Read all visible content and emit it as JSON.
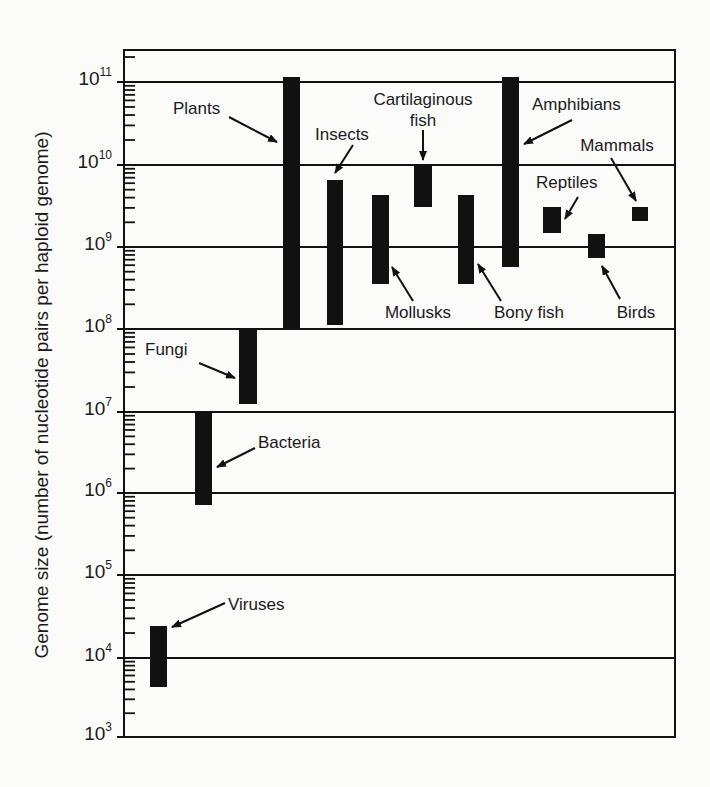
{
  "chart_data": {
    "type": "bar",
    "subtype": "floating-range-bars-log-scale",
    "title": "",
    "xlabel": "",
    "ylabel": "Genome size (number of nucleotide pairs per haploid genome)",
    "yscale": "log10",
    "ylim": [
      1000,
      200000000000
    ],
    "ytick_exponents": [
      3,
      4,
      5,
      6,
      7,
      8,
      9,
      10,
      11
    ],
    "ytick_labels": [
      "10^3",
      "10^4",
      "10^5",
      "10^6",
      "10^7",
      "10^8",
      "10^9",
      "10^10",
      "10^11"
    ],
    "grid": "horizontal at each decade",
    "legend": "none (direct labels with arrows)",
    "categories": [
      "Viruses",
      "Bacteria",
      "Fungi",
      "Plants",
      "Insects",
      "Mollusks",
      "Cartilaginous fish",
      "Bony fish",
      "Amphibians",
      "Reptiles",
      "Birds",
      "Mammals"
    ],
    "series": [
      {
        "name": "min_genome_size",
        "values": [
          4200,
          740000,
          13000000,
          100000000,
          110000000,
          350000000,
          3200000000,
          350000000,
          570000000,
          1500000000,
          790000000,
          2100000000
        ]
      },
      {
        "name": "max_genome_size",
        "values": [
          25000,
          10000000,
          100000000,
          120000000000,
          6500000000,
          4300000000,
          10000000000,
          4300000000,
          120000000000,
          3200000000,
          1500000000,
          3200000000
        ]
      }
    ],
    "bars": [
      {
        "label": "Viruses",
        "x0": 150,
        "x1": 167,
        "y_top": 626,
        "y_bot": 687,
        "text_lines": [
          "Viruses"
        ],
        "text_x": 228,
        "text_y": 610,
        "anchor": "start",
        "arrow": [
          [
            225,
            603
          ],
          [
            172,
            627
          ]
        ]
      },
      {
        "label": "Bacteria",
        "x0": 195,
        "x1": 212,
        "y_top": 412,
        "y_bot": 505,
        "text_lines": [
          "Bacteria"
        ],
        "text_x": 258,
        "text_y": 448,
        "anchor": "start",
        "arrow": [
          [
            255,
            448
          ],
          [
            217,
            467
          ]
        ]
      },
      {
        "label": "Fungi",
        "x0": 239,
        "x1": 257,
        "y_top": 329,
        "y_bot": 404,
        "text_lines": [
          "Fungi"
        ],
        "text_x": 145,
        "text_y": 355,
        "anchor": "start",
        "arrow": [
          [
            199,
            363
          ],
          [
            235,
            378
          ]
        ]
      },
      {
        "label": "Plants",
        "x0": 283,
        "x1": 300,
        "y_top": 77,
        "y_bot": 328,
        "text_lines": [
          "Plants"
        ],
        "text_x": 173,
        "text_y": 114,
        "anchor": "start",
        "arrow": [
          [
            229,
            117
          ],
          [
            277,
            142
          ]
        ]
      },
      {
        "label": "Insects",
        "x0": 327,
        "x1": 343,
        "y_top": 180,
        "y_bot": 325,
        "text_lines": [
          "Insects"
        ],
        "text_x": 315,
        "text_y": 140,
        "anchor": "start",
        "arrow": [
          [
            353,
            145
          ],
          [
            335,
            173
          ]
        ]
      },
      {
        "label": "Mollusks",
        "x0": 372,
        "x1": 389,
        "y_top": 195,
        "y_bot": 284,
        "text_lines": [
          "Mollusks"
        ],
        "text_x": 418,
        "text_y": 318,
        "anchor": "middle",
        "arrow": [
          [
            413,
            301
          ],
          [
            392,
            267
          ]
        ]
      },
      {
        "label": "Cartilaginous fish",
        "x0": 414,
        "x1": 432,
        "y_top": 166,
        "y_bot": 207,
        "text_lines": [
          "Cartilaginous",
          "fish"
        ],
        "text_x": 423,
        "text_y": 105,
        "anchor": "middle",
        "arrow": [
          [
            423,
            130
          ],
          [
            423,
            160
          ]
        ]
      },
      {
        "label": "Bony fish",
        "x0": 458,
        "x1": 474,
        "y_top": 195,
        "y_bot": 284,
        "text_lines": [
          "Bony fish"
        ],
        "text_x": 529,
        "text_y": 318,
        "anchor": "middle",
        "arrow": [
          [
            501,
            301
          ],
          [
            478,
            264
          ]
        ]
      },
      {
        "label": "Amphibians",
        "x0": 502,
        "x1": 519,
        "y_top": 77,
        "y_bot": 267,
        "text_lines": [
          "Amphibians"
        ],
        "text_x": 532,
        "text_y": 110,
        "anchor": "start",
        "arrow": [
          [
            572,
            120
          ],
          [
            524,
            144
          ]
        ]
      },
      {
        "label": "Reptiles",
        "x0": 543,
        "x1": 561,
        "y_top": 207,
        "y_bot": 233,
        "text_lines": [
          "Reptiles"
        ],
        "text_x": 536,
        "text_y": 188,
        "anchor": "start",
        "arrow": [
          [
            578,
            197
          ],
          [
            565,
            219
          ]
        ]
      },
      {
        "label": "Birds",
        "x0": 588,
        "x1": 605,
        "y_top": 234,
        "y_bot": 258,
        "text_lines": [
          "Birds"
        ],
        "text_x": 636,
        "text_y": 318,
        "anchor": "middle",
        "arrow": [
          [
            620,
            299
          ],
          [
            602,
            266
          ]
        ]
      },
      {
        "label": "Mammals",
        "x0": 632,
        "x1": 648,
        "y_top": 207,
        "y_bot": 221,
        "text_lines": [
          "Mammals"
        ],
        "text_x": 617,
        "text_y": 151,
        "anchor": "middle",
        "arrow": [
          [
            611,
            158
          ],
          [
            636,
            201
          ]
        ]
      }
    ]
  },
  "layout": {
    "frame": {
      "left": 124,
      "top": 50,
      "right": 675,
      "bottom": 737
    },
    "gridlines_y": {
      "11": 82,
      "10": 165,
      "9": 247,
      "8": 329,
      "7": 412,
      "6": 493,
      "5": 575,
      "4": 658,
      "3": 737
    },
    "ylabel_x": 48,
    "ylabel_y": 395
  },
  "colors": {
    "ink": "#111111",
    "background": "#fbfbf9",
    "label": "#1a1a1a"
  }
}
